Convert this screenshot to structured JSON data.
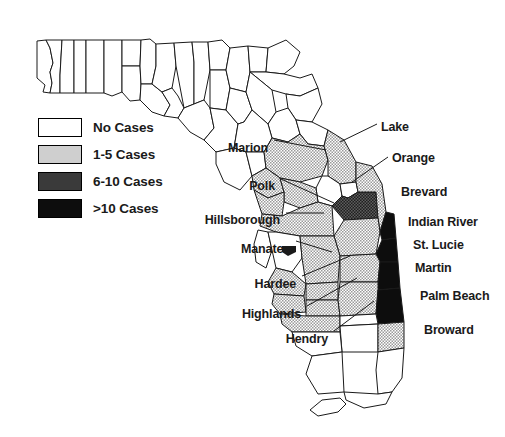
{
  "figure": {
    "type": "choropleth-map",
    "region": "Florida",
    "width": 505,
    "height": 437,
    "background": "#ffffff"
  },
  "legend": {
    "name": "map-legend",
    "items": [
      {
        "label": "No Cases",
        "fill": "#ffffff",
        "pattern": "solid",
        "class": "sw-none",
        "range": [
          0,
          0
        ]
      },
      {
        "label": "1-5 Cases",
        "fill": "#cfcfcf",
        "pattern": "stipple-light",
        "class": "sw-low",
        "range": [
          1,
          5
        ]
      },
      {
        "label": "6-10 Cases",
        "fill": "#3a3a3a",
        "pattern": "stipple-dark",
        "class": "sw-mid",
        "range": [
          6,
          10
        ]
      },
      {
        "label": ">10 Cases",
        "fill": "#0d0d0d",
        "pattern": "solid",
        "class": "sw-high",
        "range": [
          11,
          null
        ]
      }
    ]
  },
  "labels": [
    {
      "name": "label-marion",
      "text": "Marion",
      "x": 268,
      "y": 142,
      "align": "left",
      "leader": [
        [
          272,
          142
        ],
        [
          322,
          148
        ]
      ]
    },
    {
      "name": "label-lake",
      "text": "Lake",
      "x": 381,
      "y": 121,
      "align": "right",
      "leader": [
        [
          379,
          124
        ],
        [
          341,
          140
        ]
      ]
    },
    {
      "name": "label-orange",
      "text": "Orange",
      "x": 392,
      "y": 152,
      "align": "right",
      "leader": [
        [
          390,
          156
        ],
        [
          350,
          180
        ]
      ]
    },
    {
      "name": "label-brevard",
      "text": "Brevard",
      "x": 401,
      "y": 186,
      "align": "right",
      "leader": []
    },
    {
      "name": "label-polk",
      "text": "Polk",
      "x": 275,
      "y": 180,
      "align": "left",
      "leader": [
        [
          279,
          181
        ],
        [
          331,
          202
        ]
      ]
    },
    {
      "name": "label-hillsborough",
      "text": "Hillsborough",
      "x": 280,
      "y": 214,
      "align": "left",
      "leader": [
        [
          284,
          214
        ],
        [
          322,
          214
        ]
      ]
    },
    {
      "name": "label-indian-river",
      "text": "Indian River",
      "x": 408,
      "y": 216,
      "align": "right",
      "leader": []
    },
    {
      "name": "label-st-lucie",
      "text": "St. Lucie",
      "x": 413,
      "y": 239,
      "align": "right",
      "leader": []
    },
    {
      "name": "label-manatee",
      "text": "Manatee",
      "x": 290,
      "y": 243,
      "align": "left",
      "leader": [
        [
          294,
          243
        ],
        [
          330,
          253
        ]
      ]
    },
    {
      "name": "label-martin",
      "text": "Martin",
      "x": 415,
      "y": 262,
      "align": "right",
      "leader": []
    },
    {
      "name": "label-hardee",
      "text": "Hardee",
      "x": 296,
      "y": 278,
      "align": "left",
      "leader": [
        [
          300,
          277
        ],
        [
          348,
          258
        ]
      ]
    },
    {
      "name": "label-palm-beach",
      "text": "Palm Beach",
      "x": 420,
      "y": 290,
      "align": "right",
      "leader": []
    },
    {
      "name": "label-highlands",
      "text": "Highlands",
      "x": 301,
      "y": 308,
      "align": "left",
      "leader": [
        [
          305,
          307
        ],
        [
          355,
          280
        ]
      ]
    },
    {
      "name": "label-broward",
      "text": "Broward",
      "x": 424,
      "y": 324,
      "align": "right",
      "leader": []
    },
    {
      "name": "label-hendry",
      "text": "Hendry",
      "x": 328,
      "y": 333,
      "align": "left",
      "leader": [
        [
          332,
          332
        ],
        [
          372,
          303
        ]
      ]
    }
  ],
  "counties": {
    "no_cases_color": "#ffffff",
    "low_color": "#cfcfcf",
    "mid_color": "#3a3a3a",
    "high_color": "#0d0d0d",
    "stroke": "#1a1a1a"
  }
}
